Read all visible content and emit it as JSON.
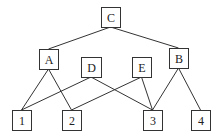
{
  "diagram": {
    "type": "hierarchy",
    "colors": {
      "stroke": "#333333",
      "text": "#222222",
      "background": "#ffffff"
    },
    "nodes": [
      {
        "id": "C",
        "label": "C",
        "x": 101,
        "y": 7,
        "w": 19,
        "h": 20
      },
      {
        "id": "A",
        "label": "A",
        "x": 39,
        "y": 49,
        "w": 19,
        "h": 20
      },
      {
        "id": "B",
        "label": "B",
        "x": 169,
        "y": 48,
        "w": 19,
        "h": 20
      },
      {
        "id": "D",
        "label": "D",
        "x": 81,
        "y": 57,
        "w": 20,
        "h": 20
      },
      {
        "id": "E",
        "label": "E",
        "x": 132,
        "y": 57,
        "w": 19,
        "h": 20
      },
      {
        "id": "1",
        "label": "1",
        "x": 12,
        "y": 110,
        "w": 19,
        "h": 20
      },
      {
        "id": "2",
        "label": "2",
        "x": 62,
        "y": 110,
        "w": 19,
        "h": 20
      },
      {
        "id": "3",
        "label": "3",
        "x": 143,
        "y": 110,
        "w": 19,
        "h": 20
      },
      {
        "id": "4",
        "label": "4",
        "x": 191,
        "y": 110,
        "w": 19,
        "h": 20
      }
    ],
    "edges": [
      {
        "from": "C",
        "to": "A"
      },
      {
        "from": "C",
        "to": "B"
      },
      {
        "from": "A",
        "to": "1"
      },
      {
        "from": "A",
        "to": "2"
      },
      {
        "from": "D",
        "to": "1"
      },
      {
        "from": "D",
        "to": "3"
      },
      {
        "from": "E",
        "to": "2"
      },
      {
        "from": "E",
        "to": "3"
      },
      {
        "from": "B",
        "to": "3"
      },
      {
        "from": "B",
        "to": "4"
      }
    ]
  }
}
